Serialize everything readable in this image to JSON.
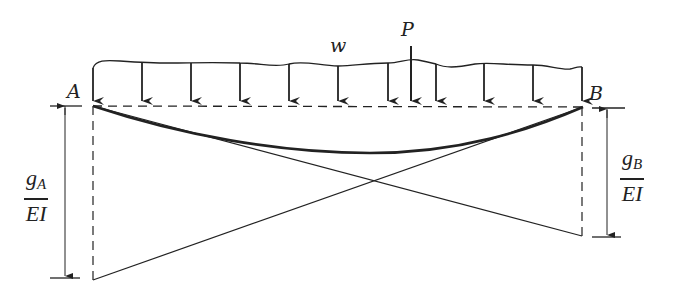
{
  "diagram": {
    "type": "beam-moment-area",
    "labels": {
      "support_left": "A",
      "support_right": "B",
      "distributed_load": "w",
      "point_load": "P",
      "left_ordinate": {
        "numerator": "g",
        "subscript": "A",
        "denominator": "EI"
      },
      "right_ordinate": {
        "numerator": "g",
        "subscript": "B",
        "denominator": "EI"
      }
    },
    "colors": {
      "line": "#222222",
      "background": "#ffffff"
    },
    "distributed_load_arrow_count": 11,
    "elements": [
      "wavy distributed load w with downward arrows along beam AB",
      "point load P",
      "dashed reference line between A and B",
      "deflection curve from A to B",
      "straight line from A to bottom of right dashed ordinate",
      "straight line from bottom of left dashed ordinate to B",
      "dimension g_A/EI at left",
      "dimension g_B/EI at right"
    ]
  }
}
